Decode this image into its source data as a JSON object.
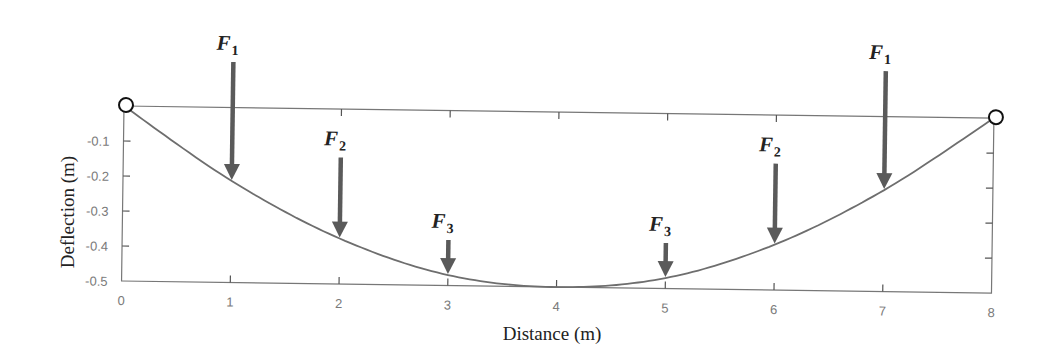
{
  "chart_data": {
    "type": "line",
    "title": "",
    "xlabel": "Distance (m)",
    "ylabel": "Deflection (m)",
    "xlim": [
      0,
      8
    ],
    "ylim": [
      -0.5,
      0
    ],
    "x_ticks": [
      "0",
      "1",
      "2",
      "3",
      "4",
      "5",
      "6",
      "7",
      "8"
    ],
    "y_ticks": [
      "-0.1",
      "-0.2",
      "-0.3",
      "-0.4",
      "-0.5"
    ],
    "grid": false,
    "series": [
      {
        "name": "Beam deflection",
        "x": [
          0,
          1,
          2,
          3,
          4,
          5,
          6,
          7,
          8
        ],
        "values": [
          0,
          -0.21,
          -0.37,
          -0.47,
          -0.5,
          -0.47,
          -0.37,
          -0.21,
          0
        ]
      }
    ],
    "supports": [
      {
        "x": 0,
        "y": 0,
        "type": "pin"
      },
      {
        "x": 8,
        "y": 0,
        "type": "pin"
      }
    ],
    "annotations": [
      {
        "label": "F",
        "subscript": "1",
        "x": 1,
        "arrow_length": "long"
      },
      {
        "label": "F",
        "subscript": "2",
        "x": 2,
        "arrow_length": "medium"
      },
      {
        "label": "F",
        "subscript": "3",
        "x": 3,
        "arrow_length": "short"
      },
      {
        "label": "F",
        "subscript": "3",
        "x": 5,
        "arrow_length": "short"
      },
      {
        "label": "F",
        "subscript": "2",
        "x": 6,
        "arrow_length": "medium"
      },
      {
        "label": "F",
        "subscript": "1",
        "x": 7,
        "arrow_length": "long"
      }
    ],
    "colors": {
      "curve": "#6e6e6e",
      "arrow": "#5a5a5a",
      "axis": "#777777",
      "support": "#111111"
    }
  }
}
